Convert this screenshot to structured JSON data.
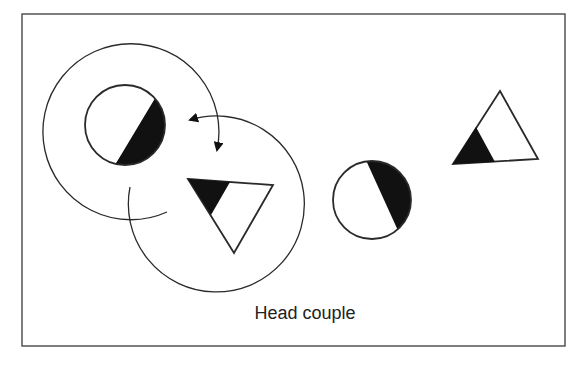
{
  "figure": {
    "caption": "Head couple",
    "colors": {
      "stroke": "#2a2a2a",
      "fill_dark": "#111111",
      "background": "#ffffff",
      "frame": "#3a3a3a"
    },
    "shapes": [
      {
        "id": "dancer-circle-left",
        "type": "circle",
        "role": "dancer",
        "center": [
          125,
          125
        ],
        "radius": 40,
        "shaded": "lower-right"
      },
      {
        "id": "dancer-triangle-center",
        "type": "triangle",
        "role": "dancer",
        "points": [
          [
            188,
            179
          ],
          [
            273,
            185
          ],
          [
            234,
            253
          ]
        ],
        "shaded": "upper-left corner"
      },
      {
        "id": "dancer-circle-right",
        "type": "circle",
        "role": "dancer",
        "center": [
          372,
          200
        ],
        "radius": 39,
        "shaded": "upper-right"
      },
      {
        "id": "dancer-triangle-right",
        "type": "triangle",
        "role": "dancer",
        "points": [
          [
            500,
            91
          ],
          [
            538,
            159
          ],
          [
            453,
            164
          ]
        ],
        "shaded": "lower-left corner"
      }
    ],
    "paths": [
      {
        "id": "path-circle-left",
        "type": "arc-arrow",
        "center": [
          130,
          133
        ],
        "radius": 88,
        "direction": "clockwise around circle dancer toward triangle position"
      },
      {
        "id": "path-triangle-center",
        "type": "arc-arrow",
        "center": [
          216,
          203
        ],
        "radius": 88,
        "direction": "counter-clockwise around triangle dancer toward circle position"
      }
    ]
  }
}
